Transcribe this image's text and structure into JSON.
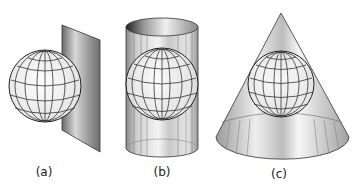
{
  "figure": {
    "panels": [
      {
        "id": "a",
        "label": "(a)",
        "surface": "plane"
      },
      {
        "id": "b",
        "label": "(b)",
        "surface": "cylinder"
      },
      {
        "id": "c",
        "label": "(c)",
        "surface": "cone"
      }
    ]
  }
}
